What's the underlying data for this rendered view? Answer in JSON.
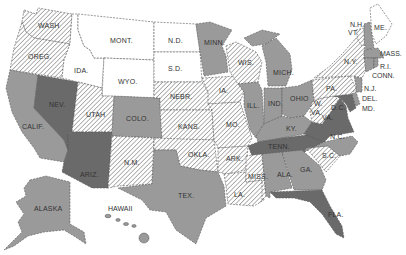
{
  "map": {
    "type": "choropleth",
    "region": "United States",
    "classes": [
      {
        "id": "white",
        "fill": "#ffffff",
        "description": "unshaded"
      },
      {
        "id": "hatch",
        "fill": "url(#hatch)",
        "description": "diagonal hatching"
      },
      {
        "id": "gray",
        "fill": "#9a9a9a",
        "description": "medium gray"
      },
      {
        "id": "dark",
        "fill": "#6a6a6a",
        "description": "dark gray"
      }
    ],
    "colors": {
      "white": "#ffffff",
      "gray": "#9a9a9a",
      "dark": "#6a6a6a",
      "hatch_line": "#8a8a8a",
      "border": "#555555",
      "label": "#333333"
    },
    "states": [
      {
        "label": "WASH",
        "class": "hatch"
      },
      {
        "label": "OREG.",
        "class": "hatch"
      },
      {
        "label": "CALIF.",
        "class": "gray"
      },
      {
        "label": "NEV.",
        "class": "dark"
      },
      {
        "label": "IDA.",
        "class": "white"
      },
      {
        "label": "MONT.",
        "class": "white"
      },
      {
        "label": "WYO.",
        "class": "white"
      },
      {
        "label": "UTAH",
        "class": "hatch"
      },
      {
        "label": "ARIZ.",
        "class": "dark"
      },
      {
        "label": "COLO.",
        "class": "gray"
      },
      {
        "label": "N.M.",
        "class": "hatch"
      },
      {
        "label": "N.D.",
        "class": "white"
      },
      {
        "label": "S.D.",
        "class": "white"
      },
      {
        "label": "NEBR.",
        "class": "hatch"
      },
      {
        "label": "KANS.",
        "class": "hatch"
      },
      {
        "label": "OKLA.",
        "class": "hatch"
      },
      {
        "label": "TEX.",
        "class": "gray"
      },
      {
        "label": "MINN.",
        "class": "gray"
      },
      {
        "label": "IA.",
        "class": "hatch"
      },
      {
        "label": "MO.",
        "class": "hatch"
      },
      {
        "label": "ARK.",
        "class": "hatch"
      },
      {
        "label": "LA.",
        "class": "hatch"
      },
      {
        "label": "WIS.",
        "class": "hatch"
      },
      {
        "label": "ILL.",
        "class": "gray"
      },
      {
        "label": "MICH.",
        "class": "gray"
      },
      {
        "label": "IND.",
        "class": "gray"
      },
      {
        "label": "OHIO",
        "class": "gray"
      },
      {
        "label": "KY.",
        "class": "gray"
      },
      {
        "label": "TENN.",
        "class": "dark"
      },
      {
        "label": "MISS.",
        "class": "hatch"
      },
      {
        "label": "ALA.",
        "class": "gray"
      },
      {
        "label": "GA.",
        "class": "gray"
      },
      {
        "label": "FLA.",
        "class": "dark"
      },
      {
        "label": "S.C.",
        "class": "hatch"
      },
      {
        "label": "N.C.",
        "class": "gray"
      },
      {
        "label": "VA.",
        "class": "dark"
      },
      {
        "label": "W. VA.",
        "class": "hatch"
      },
      {
        "label": "D.C.",
        "class": "dark"
      },
      {
        "label": "MD.",
        "class": "dark"
      },
      {
        "label": "DEL.",
        "class": "gray"
      },
      {
        "label": "PA.",
        "class": "hatch"
      },
      {
        "label": "N.J.",
        "class": "gray"
      },
      {
        "label": "N.Y.",
        "class": "hatch"
      },
      {
        "label": "CONN.",
        "class": "gray"
      },
      {
        "label": "R.I.",
        "class": "gray"
      },
      {
        "label": "MASS.",
        "class": "gray"
      },
      {
        "label": "VT.",
        "class": "hatch"
      },
      {
        "label": "N.H.",
        "class": "gray"
      },
      {
        "label": "ME.",
        "class": "white"
      },
      {
        "label": "ALASKA",
        "class": "gray"
      },
      {
        "label": "HAWAII",
        "class": "gray"
      }
    ],
    "labels": {
      "wash": "WASH",
      "oreg": "OREG.",
      "calif": "CALIF.",
      "nev": "NEV.",
      "ida": "IDA.",
      "mont": "MONT.",
      "wyo": "WYO.",
      "utah": "UTAH",
      "ariz": "ARIZ.",
      "colo": "COLO.",
      "nm": "N.M.",
      "nd": "N.D.",
      "sd": "S.D.",
      "nebr": "NEBR.",
      "kans": "KANS.",
      "okla": "OKLA.",
      "tex": "TEX.",
      "minn": "MINN.",
      "ia": "IA.",
      "mo": "MO.",
      "ark": "ARK.",
      "la": "LA.",
      "wis": "WIS.",
      "ill": "ILL.",
      "mich": "MICH.",
      "ind": "IND.",
      "ohio": "OHIO",
      "ky": "KY.",
      "tenn": "TENN.",
      "miss": "MISS.",
      "ala": "ALA.",
      "ga": "GA.",
      "fla": "FLA.",
      "sc": "S.C.",
      "nc": "N.C.",
      "va": "VA.",
      "wva_w": "W.",
      "wva_va": "VA.",
      "dc": "D.C.",
      "md": "MD.",
      "del": "DEL.",
      "pa": "PA.",
      "nj": "N.J.",
      "ny": "N.Y.",
      "conn": "CONN.",
      "ri": "R.I.",
      "mass": "MASS.",
      "vt": "VT.",
      "nh": "N.H.",
      "me": "ME.",
      "alaska": "ALASKA",
      "hawaii": "HAWAII"
    }
  }
}
